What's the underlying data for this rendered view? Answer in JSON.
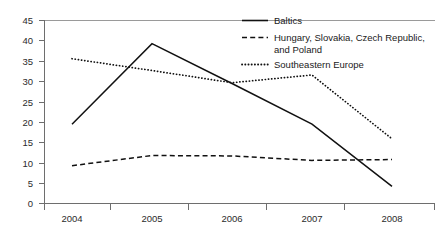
{
  "chart_data": {
    "type": "line",
    "title": "",
    "xlabel": "",
    "ylabel": "",
    "categories": [
      "2004",
      "2005",
      "2006",
      "2007",
      "2008"
    ],
    "x": [
      2004,
      2005,
      2006,
      2007,
      2008
    ],
    "xlim": [
      2004,
      2008
    ],
    "ylim": [
      0,
      45
    ],
    "y_ticks": [
      0,
      5,
      10,
      15,
      20,
      25,
      30,
      35,
      40,
      45
    ],
    "x_ticks": [
      "2004",
      "2005",
      "2006",
      "2007",
      "2008"
    ],
    "grid": false,
    "legend_position": "top-right",
    "series": [
      {
        "name": "Baltics",
        "style": "solid",
        "color": "#111111",
        "values": [
          19.5,
          39.3,
          29.5,
          19.5,
          4.2
        ]
      },
      {
        "name": "Hungary, Slovakia, Czech Republic, and Poland",
        "style": "dashed",
        "color": "#111111",
        "values": [
          9.3,
          11.8,
          11.7,
          10.6,
          10.8
        ]
      },
      {
        "name": "Southeastern Europe",
        "style": "dotted",
        "color": "#111111",
        "values": [
          35.6,
          32.7,
          29.7,
          31.6,
          15.9
        ]
      }
    ]
  },
  "legend": {
    "entries": [
      {
        "label": "Baltics",
        "line2": ""
      },
      {
        "label": "Hungary, Slovakia, Czech Republic,",
        "line2": "and Poland"
      },
      {
        "label": "Southeastern Europe",
        "line2": ""
      }
    ]
  },
  "axis": {
    "y_tick_labels": [
      "45",
      "40",
      "35",
      "30",
      "25",
      "20",
      "15",
      "10",
      "5",
      "0"
    ],
    "x_tick_labels": [
      "2004",
      "2005",
      "2006",
      "2007",
      "2008"
    ]
  },
  "colors": {
    "series_line": "#111111",
    "axis": "#6e6e6e",
    "top_rule": "#9a9a9a",
    "text": "#1a1a1a",
    "background": "#ffffff"
  }
}
